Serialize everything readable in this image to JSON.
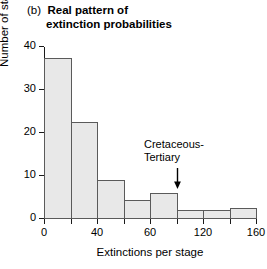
{
  "title": {
    "panel_letter": "(b)",
    "line1": "Real pattern of",
    "line2": "extinction probabilities"
  },
  "annotation": {
    "line1": "Cretaceous-",
    "line2": "Tertiary",
    "arrow_icon": "down-arrow-icon"
  },
  "colors": {
    "bar_fill": "#e8e8e8",
    "bar_edge": "#5a5a5a",
    "axis": "#1a1a1a",
    "text": "#000000",
    "background": "#ffffff"
  },
  "chart_data": {
    "type": "bar",
    "xlabel": "Extinctions per stage",
    "ylabel": "Number of stages",
    "xlim": [
      0,
      160
    ],
    "ylim": [
      0,
      40
    ],
    "grid": false,
    "legend": false,
    "bin_width": 20,
    "x_tick_values": [
      0,
      20,
      40,
      60,
      80,
      100,
      120,
      140,
      160
    ],
    "x_tick_labels": [
      "0",
      "",
      "40",
      "",
      "60",
      "",
      "120",
      "",
      "160"
    ],
    "y_tick_values": [
      0,
      10,
      20,
      30,
      40
    ],
    "y_tick_labels": [
      "0",
      "10",
      "20",
      "30",
      "40"
    ],
    "bin_edges": [
      0,
      20,
      40,
      60,
      80,
      100,
      120,
      140,
      160
    ],
    "categories": [
      "0-20",
      "20-40",
      "40-60",
      "60-80",
      "80-100",
      "100-120",
      "120-140",
      "140-160"
    ],
    "values": [
      37.5,
      22.5,
      9,
      4.5,
      6,
      2,
      2,
      2.5
    ],
    "annotations": [
      {
        "text": "Cretaceous-Tertiary",
        "points_to_category": "80-100",
        "arrow": "down"
      }
    ]
  }
}
